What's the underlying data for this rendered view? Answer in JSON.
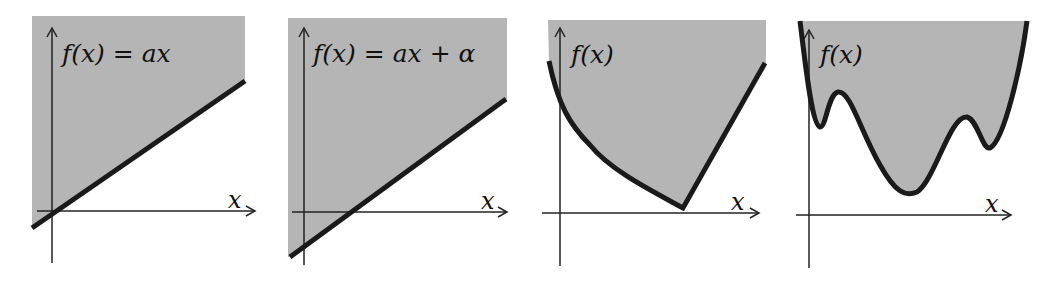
{
  "figure": {
    "fill_color": "#b5b5b5",
    "curve_color": "#1a1a1a",
    "axis_color": "#222222",
    "panels": [
      {
        "id": "linear",
        "label": "f(x) = ax",
        "x_axis_label": "x"
      },
      {
        "id": "affine",
        "label": "f(x) = ax + α",
        "x_axis_label": "x"
      },
      {
        "id": "convex",
        "label": "f(x)",
        "x_axis_label": "x"
      },
      {
        "id": "nonconvex",
        "label": "f(x)",
        "x_axis_label": "x"
      }
    ]
  }
}
